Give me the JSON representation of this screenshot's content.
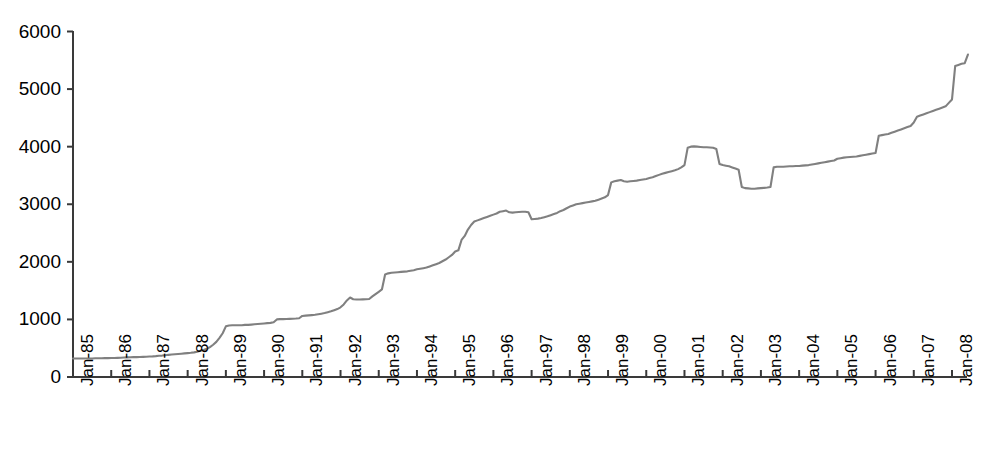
{
  "chart_data": {
    "type": "line",
    "title": "",
    "subtitle": "",
    "xlabel": "",
    "ylabel": "",
    "ylim": [
      0,
      6000
    ],
    "yticks": [
      0,
      1000,
      2000,
      3000,
      4000,
      5000,
      6000
    ],
    "ytick_labels": [
      "0",
      "1000",
      "2000",
      "3000",
      "4000",
      "5000",
      "6000"
    ],
    "grid": false,
    "legend": "none",
    "line_color": "#808080",
    "axis_color": "#333333",
    "xtick_labels": [
      "Jan-85",
      "Jan-86",
      "Jan-87",
      "Jan-88",
      "Jan-89",
      "Jan-90",
      "Jan-91",
      "Jan-92",
      "Jan-93",
      "Jan-94",
      "Jan-95",
      "Jan-96",
      "Jan-97",
      "Jan-98",
      "Jan-99",
      "Jan-00",
      "Jan-01",
      "Jan-02",
      "Jan-03",
      "Jan-04",
      "Jan-05",
      "Jan-06",
      "Jan-07",
      "Jan-08"
    ],
    "x": [
      "Jan-85",
      "Feb-85",
      "Mar-85",
      "Apr-85",
      "May-85",
      "Jun-85",
      "Jul-85",
      "Aug-85",
      "Sep-85",
      "Oct-85",
      "Nov-85",
      "Dec-85",
      "Jan-86",
      "Feb-86",
      "Mar-86",
      "Apr-86",
      "May-86",
      "Jun-86",
      "Jul-86",
      "Aug-86",
      "Sep-86",
      "Oct-86",
      "Nov-86",
      "Dec-86",
      "Jan-87",
      "Feb-87",
      "Mar-87",
      "Apr-87",
      "May-87",
      "Jun-87",
      "Jul-87",
      "Aug-87",
      "Sep-87",
      "Oct-87",
      "Nov-87",
      "Dec-87",
      "Jan-88",
      "Feb-88",
      "Mar-88",
      "Apr-88",
      "May-88",
      "Jun-88",
      "Jul-88",
      "Aug-88",
      "Sep-88",
      "Oct-88",
      "Nov-88",
      "Dec-88",
      "Jan-89",
      "Feb-89",
      "Mar-89",
      "Apr-89",
      "May-89",
      "Jun-89",
      "Jul-89",
      "Aug-89",
      "Sep-89",
      "Oct-89",
      "Nov-89",
      "Dec-89",
      "Jan-90",
      "Feb-90",
      "Mar-90",
      "Apr-90",
      "May-90",
      "Jun-90",
      "Jul-90",
      "Aug-90",
      "Sep-90",
      "Oct-90",
      "Nov-90",
      "Dec-90",
      "Jan-91",
      "Feb-91",
      "Mar-91",
      "Apr-91",
      "May-91",
      "Jun-91",
      "Jul-91",
      "Aug-91",
      "Sep-91",
      "Oct-91",
      "Nov-91",
      "Dec-91",
      "Jan-92",
      "Feb-92",
      "Mar-92",
      "Apr-92",
      "May-92",
      "Jun-92",
      "Jul-92",
      "Aug-92",
      "Sep-92",
      "Oct-92",
      "Nov-92",
      "Dec-92",
      "Jan-93",
      "Feb-93",
      "Mar-93",
      "Apr-93",
      "May-93",
      "Jun-93",
      "Jul-93",
      "Aug-93",
      "Sep-93",
      "Oct-93",
      "Nov-93",
      "Dec-93",
      "Jan-94",
      "Feb-94",
      "Mar-94",
      "Apr-94",
      "May-94",
      "Jun-94",
      "Jul-94",
      "Aug-94",
      "Sep-94",
      "Oct-94",
      "Nov-94",
      "Dec-94",
      "Jan-95",
      "Feb-95",
      "Mar-95",
      "Apr-95",
      "May-95",
      "Jun-95",
      "Jul-95",
      "Aug-95",
      "Sep-95",
      "Oct-95",
      "Nov-95",
      "Dec-95",
      "Jan-96",
      "Feb-96",
      "Mar-96",
      "Apr-96",
      "May-96",
      "Jun-96",
      "Jul-96",
      "Aug-96",
      "Sep-96",
      "Oct-96",
      "Nov-96",
      "Dec-96",
      "Jan-97",
      "Feb-97",
      "Mar-97",
      "Apr-97",
      "May-97",
      "Jun-97",
      "Jul-97",
      "Aug-97",
      "Sep-97",
      "Oct-97",
      "Nov-97",
      "Dec-97",
      "Jan-98",
      "Feb-98",
      "Mar-98",
      "Apr-98",
      "May-98",
      "Jun-98",
      "Jul-98",
      "Aug-98",
      "Sep-98",
      "Oct-98",
      "Nov-98",
      "Dec-98",
      "Jan-99",
      "Feb-99",
      "Mar-99",
      "Apr-99",
      "May-99",
      "Jun-99",
      "Jul-99",
      "Aug-99",
      "Sep-99",
      "Oct-99",
      "Nov-99",
      "Dec-99",
      "Jan-00",
      "Feb-00",
      "Mar-00",
      "Apr-00",
      "May-00",
      "Jun-00",
      "Jul-00",
      "Aug-00",
      "Sep-00",
      "Oct-00",
      "Nov-00",
      "Dec-00",
      "Jan-01",
      "Feb-01",
      "Mar-01",
      "Apr-01",
      "May-01",
      "Jun-01",
      "Jul-01",
      "Aug-01",
      "Sep-01",
      "Oct-01",
      "Nov-01",
      "Dec-01",
      "Jan-02",
      "Feb-02",
      "Mar-02",
      "Apr-02",
      "May-02",
      "Jun-02",
      "Jul-02",
      "Aug-02",
      "Sep-02",
      "Oct-02",
      "Nov-02",
      "Dec-02",
      "Jan-03",
      "Feb-03",
      "Mar-03",
      "Apr-03",
      "May-03",
      "Jun-03",
      "Jul-03",
      "Aug-03",
      "Sep-03",
      "Oct-03",
      "Nov-03",
      "Dec-03",
      "Jan-04",
      "Feb-04",
      "Mar-04",
      "Apr-04",
      "May-04",
      "Jun-04",
      "Jul-04",
      "Aug-04",
      "Sep-04",
      "Oct-04",
      "Nov-04",
      "Dec-04",
      "Jan-05",
      "Feb-05",
      "Mar-05",
      "Apr-05",
      "May-05",
      "Jun-05",
      "Jul-05",
      "Aug-05",
      "Sep-05",
      "Oct-05",
      "Nov-05",
      "Dec-05",
      "Jan-06",
      "Feb-06",
      "Mar-06",
      "Apr-06",
      "May-06",
      "Jun-06",
      "Jul-06",
      "Aug-06",
      "Sep-06",
      "Oct-06",
      "Nov-06",
      "Dec-06",
      "Jan-07",
      "Feb-07",
      "Mar-07",
      "Apr-07",
      "May-07",
      "Jun-07",
      "Jul-07",
      "Aug-07",
      "Sep-07",
      "Oct-07",
      "Nov-07",
      "Dec-07",
      "Jan-08",
      "Feb-08",
      "Mar-08",
      "Apr-08",
      "May-08",
      "Jun-08"
    ],
    "values": [
      320,
      320,
      320,
      320,
      322,
      322,
      322,
      325,
      325,
      325,
      328,
      328,
      330,
      330,
      332,
      335,
      338,
      340,
      342,
      345,
      345,
      348,
      350,
      352,
      355,
      358,
      362,
      368,
      372,
      378,
      385,
      390,
      395,
      400,
      405,
      410,
      415,
      420,
      428,
      440,
      455,
      470,
      490,
      520,
      560,
      610,
      680,
      760,
      880,
      895,
      900,
      900,
      900,
      900,
      905,
      905,
      910,
      915,
      920,
      925,
      930,
      935,
      940,
      950,
      1000,
      1005,
      1005,
      1008,
      1010,
      1012,
      1015,
      1020,
      1060,
      1065,
      1070,
      1075,
      1080,
      1090,
      1100,
      1110,
      1125,
      1140,
      1160,
      1180,
      1210,
      1260,
      1330,
      1380,
      1350,
      1345,
      1345,
      1348,
      1350,
      1355,
      1400,
      1440,
      1480,
      1520,
      1780,
      1800,
      1810,
      1815,
      1820,
      1825,
      1830,
      1835,
      1845,
      1855,
      1870,
      1880,
      1890,
      1900,
      1920,
      1940,
      1960,
      1980,
      2010,
      2040,
      2080,
      2120,
      2180,
      2200,
      2380,
      2450,
      2560,
      2640,
      2700,
      2720,
      2740,
      2760,
      2780,
      2800,
      2820,
      2840,
      2870,
      2880,
      2890,
      2860,
      2855,
      2860,
      2865,
      2870,
      2870,
      2860,
      2740,
      2745,
      2750,
      2760,
      2775,
      2790,
      2810,
      2830,
      2850,
      2880,
      2900,
      2930,
      2960,
      2980,
      3000,
      3010,
      3020,
      3030,
      3040,
      3050,
      3060,
      3080,
      3100,
      3120,
      3160,
      3380,
      3400,
      3410,
      3420,
      3400,
      3390,
      3400,
      3405,
      3410,
      3420,
      3430,
      3440,
      3455,
      3470,
      3490,
      3510,
      3530,
      3545,
      3560,
      3575,
      3590,
      3610,
      3640,
      3680,
      3980,
      4000,
      4005,
      4000,
      3995,
      3990,
      3990,
      3985,
      3980,
      3960,
      3700,
      3680,
      3670,
      3660,
      3640,
      3620,
      3600,
      3300,
      3280,
      3275,
      3270,
      3270,
      3275,
      3280,
      3285,
      3290,
      3300,
      3640,
      3650,
      3650,
      3650,
      3655,
      3660,
      3660,
      3665,
      3665,
      3670,
      3675,
      3680,
      3690,
      3700,
      3710,
      3720,
      3730,
      3740,
      3750,
      3760,
      3790,
      3800,
      3810,
      3815,
      3820,
      3825,
      3830,
      3840,
      3850,
      3860,
      3870,
      3880,
      3890,
      4190,
      4200,
      4210,
      4220,
      4240,
      4260,
      4280,
      4300,
      4320,
      4340,
      4360,
      4420,
      4520,
      4540,
      4560,
      4580,
      4600,
      4620,
      4640,
      4660,
      4680,
      4700,
      4760,
      4820,
      5400,
      5420,
      5440,
      5450,
      5600
    ]
  }
}
